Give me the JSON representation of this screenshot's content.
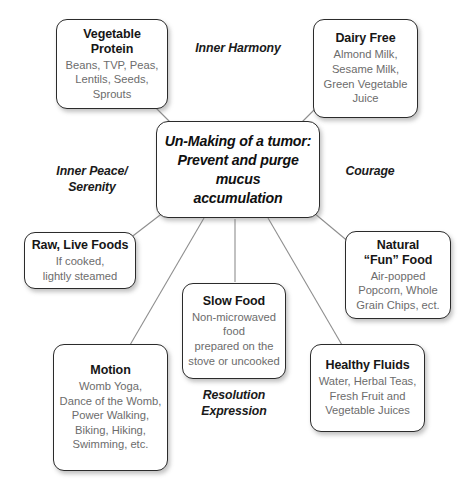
{
  "diagram": {
    "center": {
      "title": "Un-Making of a tumor:\nPrevent and purge\nmucus\naccumulation"
    },
    "nodes": [
      {
        "id": "vegetable-protein",
        "title": "Vegetable Protein",
        "body": "Beans, TVP, Peas,\nLentils, Seeds,\nSprouts"
      },
      {
        "id": "dairy-free",
        "title": "Dairy Free",
        "body": "Almond Milk,\nSesame Milk,\nGreen Vegetable\nJuice"
      },
      {
        "id": "raw-live-foods",
        "title": "Raw, Live Foods",
        "body": "If cooked,\nlightly steamed"
      },
      {
        "id": "natural-fun-food",
        "title": "Natural\n“Fun” Food",
        "body": "Air-popped\nPopcorn, Whole\nGrain Chips, ect."
      },
      {
        "id": "motion",
        "title": "Motion",
        "body": "Womb Yoga,\nDance of the Womb,\nPower Walking,\nBiking, Hiking,\nSwimming, etc."
      },
      {
        "id": "slow-food",
        "title": "Slow Food",
        "body": "Non-microwaved\nfood\nprepared on the\nstove or uncooked"
      },
      {
        "id": "healthy-fluids",
        "title": "Healthy Fluids",
        "body": "Water, Herbal Teas,\nFresh Fruit and\nVegetable Juices"
      }
    ],
    "edge_labels": [
      {
        "id": "inner-harmony",
        "text": "Inner Harmony"
      },
      {
        "id": "inner-peace-serenity",
        "text": "Inner Peace/\nSerenity"
      },
      {
        "id": "courage",
        "text": "Courage"
      },
      {
        "id": "resolution-expression",
        "text": "Resolution\nExpression"
      }
    ],
    "colors": {
      "box_border": "#2b2b2b",
      "box_background": "#ffffff",
      "title_text": "#161616",
      "body_text": "#6c6c6c",
      "connector_line": "#8e8e8e",
      "page_background": "#ffffff"
    }
  }
}
